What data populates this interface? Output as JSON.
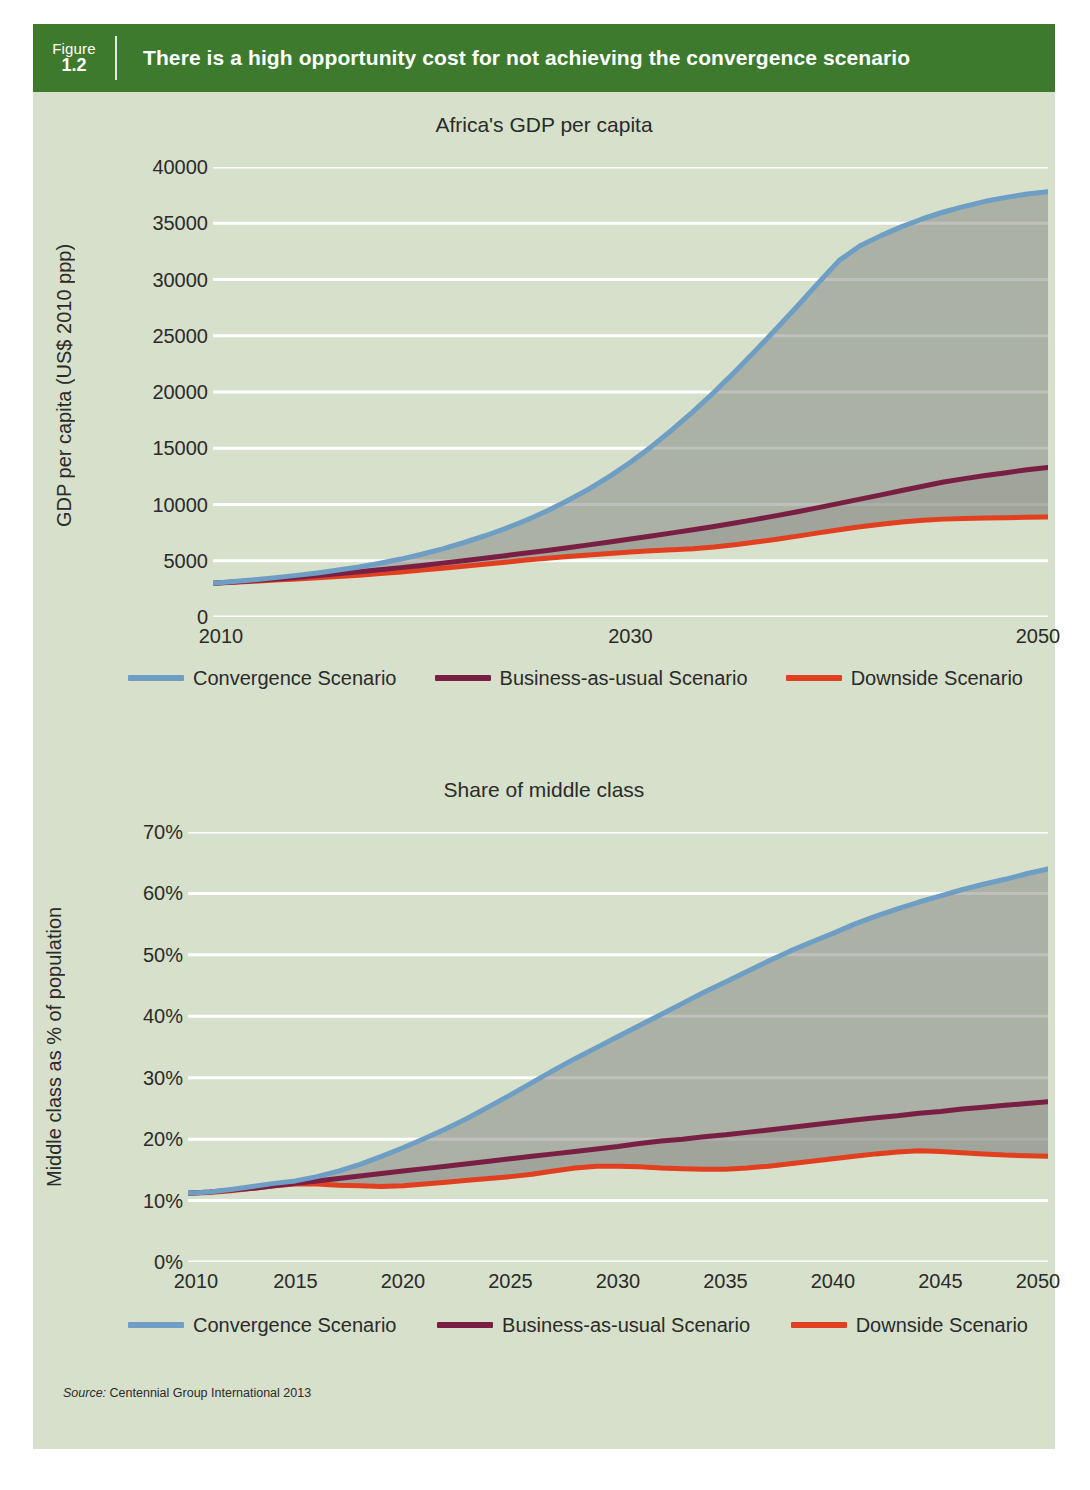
{
  "figure": {
    "label_word": "Figure",
    "number": "1.2",
    "title": "There is a high opportunity cost for not achieving the convergence scenario",
    "band_color": "#3d7a2e",
    "panel_color": "#d6e0ca",
    "source_prefix": "Source:",
    "source_text": "Centennial Group International 2013"
  },
  "series_colors": {
    "convergence": "#6e9ec4",
    "business_as_usual": "#7a1f44",
    "downside": "#e0401f",
    "band_fill": "#8a8a86",
    "gridline": "#ffffff"
  },
  "legend": {
    "items": [
      {
        "label": "Convergence Scenario",
        "color": "#6e9ec4",
        "key": "convergence"
      },
      {
        "label": "Business-as-usual Scenario",
        "color": "#7a1f44",
        "key": "business_as_usual"
      },
      {
        "label": "Downside Scenario",
        "color": "#e0401f",
        "key": "downside"
      }
    ]
  },
  "chart_data": [
    {
      "id": "gdp-per-capita",
      "type": "line",
      "title": "Africa's GDP per capita",
      "xlabel": "",
      "ylabel": "GDP per capita (US$ 2010 ppp)",
      "x": [
        2010,
        2011,
        2012,
        2013,
        2014,
        2015,
        2016,
        2017,
        2018,
        2019,
        2020,
        2021,
        2022,
        2023,
        2024,
        2025,
        2026,
        2027,
        2028,
        2029,
        2030,
        2031,
        2032,
        2033,
        2034,
        2035,
        2036,
        2037,
        2038,
        2039,
        2040,
        2041,
        2042,
        2043,
        2044,
        2045,
        2046,
        2047,
        2048,
        2049,
        2050
      ],
      "xlim": [
        2010,
        2050
      ],
      "ylim": [
        0,
        40000
      ],
      "yticks": [
        0,
        5000,
        10000,
        15000,
        20000,
        25000,
        30000,
        35000,
        40000
      ],
      "ytick_labels": [
        "0",
        "5000",
        "10000",
        "15000",
        "20000",
        "25000",
        "30000",
        "35000",
        "40000"
      ],
      "xticks": [
        2010,
        2030,
        2050
      ],
      "xtick_labels": [
        "2010",
        "2030",
        "2050"
      ],
      "grid": "horizontal",
      "legend_position": "below",
      "series": [
        {
          "name": "Convergence Scenario",
          "color": "#6e9ec4",
          "values": [
            3000,
            3150,
            3320,
            3500,
            3700,
            3920,
            4170,
            4450,
            4780,
            5150,
            5580,
            6060,
            6600,
            7200,
            7860,
            8600,
            9430,
            10350,
            11370,
            12500,
            13760,
            15140,
            16650,
            18260,
            19980,
            21800,
            23700,
            25650,
            27650,
            29700,
            31700,
            33000,
            33900,
            34700,
            35400,
            36000,
            36500,
            36950,
            37300,
            37600,
            37800
          ]
        },
        {
          "name": "Business-as-usual Scenario",
          "color": "#7a1f44",
          "values": [
            3000,
            3120,
            3250,
            3380,
            3520,
            3680,
            3850,
            4020,
            4200,
            4390,
            4580,
            4790,
            5000,
            5220,
            5450,
            5680,
            5920,
            6160,
            6410,
            6670,
            6930,
            7200,
            7480,
            7760,
            8050,
            8360,
            8680,
            9010,
            9360,
            9720,
            10100,
            10480,
            10860,
            11240,
            11620,
            12000,
            12300,
            12570,
            12830,
            13080,
            13300
          ]
        },
        {
          "name": "Downside Scenario",
          "color": "#e0401f",
          "values": [
            3000,
            3090,
            3180,
            3280,
            3380,
            3490,
            3600,
            3720,
            3860,
            4010,
            4170,
            4330,
            4500,
            4680,
            4870,
            5060,
            5230,
            5380,
            5520,
            5650,
            5780,
            5880,
            5970,
            6070,
            6220,
            6420,
            6660,
            6920,
            7190,
            7480,
            7760,
            8020,
            8250,
            8440,
            8590,
            8700,
            8760,
            8800,
            8830,
            8860,
            8900
          ]
        }
      ]
    },
    {
      "id": "share-of-middle-class",
      "type": "line",
      "title": "Share of middle class",
      "xlabel": "",
      "ylabel": "Middle class as % of population",
      "x": [
        2010,
        2011,
        2012,
        2013,
        2014,
        2015,
        2016,
        2017,
        2018,
        2019,
        2020,
        2021,
        2022,
        2023,
        2024,
        2025,
        2026,
        2027,
        2028,
        2029,
        2030,
        2031,
        2032,
        2033,
        2034,
        2035,
        2036,
        2037,
        2038,
        2039,
        2040,
        2041,
        2042,
        2043,
        2044,
        2045,
        2046,
        2047,
        2048,
        2049,
        2050
      ],
      "xlim": [
        2010,
        2050
      ],
      "ylim": [
        0,
        70
      ],
      "yticks": [
        0,
        10,
        20,
        30,
        40,
        50,
        60,
        70
      ],
      "ytick_labels": [
        "0%",
        "10%",
        "20%",
        "30%",
        "40%",
        "50%",
        "60%",
        "70%"
      ],
      "xticks": [
        2010,
        2015,
        2020,
        2025,
        2030,
        2035,
        2040,
        2045,
        2050
      ],
      "xtick_labels": [
        "2010",
        "2015",
        "2020",
        "2025",
        "2030",
        "2035",
        "2040",
        "2045",
        "2050"
      ],
      "grid": "horizontal",
      "legend_position": "below",
      "series": [
        {
          "name": "Convergence Scenario",
          "color": "#6e9ec4",
          "values": [
            11.2,
            11.4,
            11.8,
            12.3,
            12.8,
            13.2,
            13.9,
            14.8,
            15.9,
            17.2,
            18.6,
            20.1,
            21.7,
            23.4,
            25.3,
            27.2,
            29.2,
            31.2,
            33.1,
            34.9,
            36.7,
            38.5,
            40.3,
            42.1,
            43.9,
            45.6,
            47.3,
            49.0,
            50.6,
            52.1,
            53.5,
            55.0,
            56.3,
            57.5,
            58.6,
            59.6,
            60.6,
            61.5,
            62.3,
            63.2,
            64.0
          ]
        },
        {
          "name": "Business-as-usual Scenario",
          "color": "#7a1f44",
          "values": [
            11.2,
            11.4,
            11.7,
            12.0,
            12.4,
            12.8,
            13.2,
            13.6,
            14.0,
            14.4,
            14.8,
            15.2,
            15.6,
            16.0,
            16.4,
            16.8,
            17.2,
            17.6,
            18.0,
            18.4,
            18.8,
            19.3,
            19.7,
            20.0,
            20.4,
            20.7,
            21.1,
            21.5,
            21.9,
            22.3,
            22.7,
            23.1,
            23.5,
            23.8,
            24.2,
            24.5,
            24.9,
            25.2,
            25.5,
            25.8,
            26.1
          ]
        },
        {
          "name": "Downside Scenario",
          "color": "#e0401f",
          "values": [
            11.2,
            11.3,
            11.6,
            12.0,
            12.4,
            12.7,
            12.7,
            12.5,
            12.4,
            12.3,
            12.4,
            12.7,
            13.0,
            13.3,
            13.6,
            13.9,
            14.3,
            14.8,
            15.3,
            15.6,
            15.6,
            15.5,
            15.3,
            15.2,
            15.1,
            15.1,
            15.3,
            15.6,
            16.0,
            16.4,
            16.8,
            17.2,
            17.6,
            17.9,
            18.1,
            18.0,
            17.8,
            17.6,
            17.4,
            17.3,
            17.2
          ]
        }
      ]
    }
  ]
}
